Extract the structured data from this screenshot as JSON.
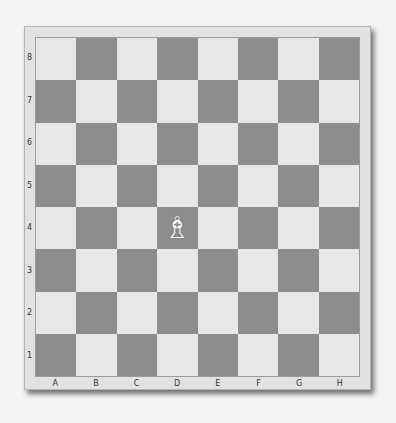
{
  "board": {
    "files": [
      "A",
      "B",
      "C",
      "D",
      "E",
      "F",
      "G",
      "H"
    ],
    "ranks": [
      "8",
      "7",
      "6",
      "5",
      "4",
      "3",
      "2",
      "1"
    ],
    "colors": {
      "light": "#e7e7e7",
      "dark": "#8d8d8d",
      "frame": "#e2e2e2"
    },
    "pieces": [
      {
        "square": "D4",
        "type": "bishop",
        "color": "white",
        "glyph": "♗"
      }
    ]
  }
}
